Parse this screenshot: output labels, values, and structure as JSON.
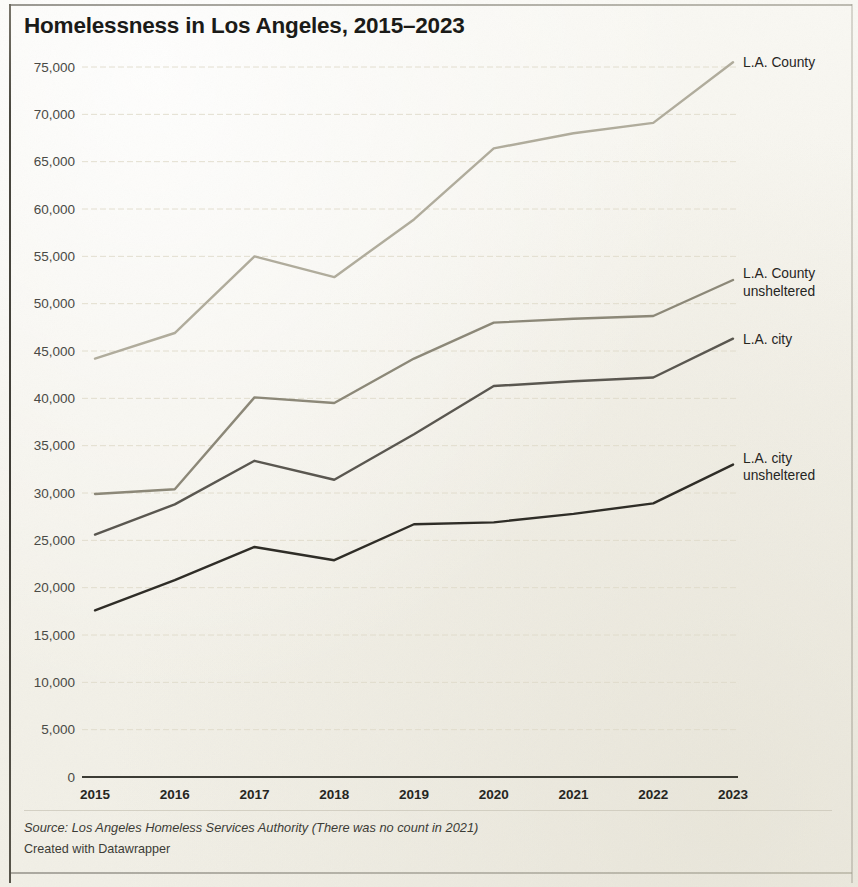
{
  "title": "Homelessness in Los Angeles, 2015–2023",
  "footer": {
    "source": "Source: Los Angeles Homeless Services Authority (There was no count in 2021)",
    "credit": "Created with Datawrapper"
  },
  "colors": {
    "background": "#f6f5ef",
    "title": "#1b1b18",
    "gridline": "#ded9c8",
    "axis": "#33332c",
    "la_county": "#b0ac9c",
    "la_county_unsheltered": "#8c8878",
    "la_city": "#5a5750",
    "la_city_unsheltered": "#2f2d27"
  },
  "chart_data": {
    "type": "line",
    "title": "Homelessness in Los Angeles, 2015–2023",
    "xlabel": "",
    "ylabel": "",
    "x": [
      2015,
      2016,
      2017,
      2018,
      2019,
      2020,
      2021,
      2022,
      2023
    ],
    "categories": [
      "2015",
      "2016",
      "2017",
      "2018",
      "2019",
      "2020",
      "2021",
      "2022",
      "2023"
    ],
    "xlim": [
      2015,
      2023
    ],
    "ylim": [
      0,
      75000
    ],
    "ytick_labels": [
      "0",
      "5,000",
      "10,000",
      "15,000",
      "20,000",
      "25,000",
      "30,000",
      "35,000",
      "40,000",
      "45,000",
      "50,000",
      "55,000",
      "60,000",
      "65,000",
      "70,000",
      "75,000"
    ],
    "ytick_values": [
      0,
      5000,
      10000,
      15000,
      20000,
      25000,
      30000,
      35000,
      40000,
      45000,
      50000,
      55000,
      60000,
      65000,
      70000,
      75000
    ],
    "grid": true,
    "legend_position": "right-inline",
    "note": "There was no count in 2021; 2021 values are interpolated across the gap.",
    "series": [
      {
        "name": "L.A. County",
        "color": "#b0ac9c",
        "label_lines": [
          "L.A. County"
        ],
        "values": [
          44200,
          46900,
          55000,
          52800,
          58900,
          66400,
          68000,
          69100,
          75500
        ]
      },
      {
        "name": "L.A. County unsheltered",
        "color": "#8c8878",
        "label_lines": [
          "L.A. County",
          "unsheltered"
        ],
        "values": [
          29900,
          30400,
          40100,
          39500,
          44200,
          48000,
          48400,
          48700,
          52500
        ]
      },
      {
        "name": "L.A. city",
        "color": "#5a5750",
        "label_lines": [
          "L.A. city"
        ],
        "values": [
          25600,
          28800,
          33400,
          31400,
          36200,
          41300,
          41800,
          42200,
          46300
        ]
      },
      {
        "name": "L.A. city unsheltered",
        "color": "#2f2d27",
        "label_lines": [
          "L.A. city",
          "unsheltered"
        ],
        "values": [
          17600,
          20800,
          24300,
          22900,
          26700,
          26900,
          27800,
          28900,
          33000
        ]
      }
    ]
  }
}
